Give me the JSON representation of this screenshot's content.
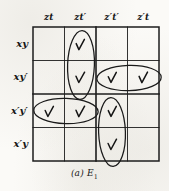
{
  "figure": {
    "type": "karnaugh-map",
    "caption_label": "(a)",
    "caption_expression": "E",
    "caption_subscript": "1",
    "ink_color": "#1a1a1a",
    "paper_color": "#fbfaf7"
  },
  "grid": {
    "rows": 4,
    "columns": 4,
    "column_headers": [
      {
        "id": "col-zt",
        "label": "zt"
      },
      {
        "id": "col-ztp",
        "label": "zt′"
      },
      {
        "id": "col-zptp",
        "label": "z′t′"
      },
      {
        "id": "col-zpt",
        "label": "z′t"
      }
    ],
    "row_headers": [
      {
        "id": "row-xy",
        "label": "xy"
      },
      {
        "id": "row-xyp",
        "label": "xy′"
      },
      {
        "id": "row-xpyp",
        "label": "x′y′"
      },
      {
        "id": "row-xpy",
        "label": "x′y"
      }
    ]
  },
  "marks": [
    {
      "id": "mark-r1c2",
      "row": 1,
      "col": 2,
      "glyph": "check"
    },
    {
      "id": "mark-r2c2",
      "row": 2,
      "col": 2,
      "glyph": "check"
    },
    {
      "id": "mark-r2c3",
      "row": 2,
      "col": 3,
      "glyph": "check"
    },
    {
      "id": "mark-r2c4",
      "row": 2,
      "col": 4,
      "glyph": "check"
    },
    {
      "id": "mark-r3c1",
      "row": 3,
      "col": 1,
      "glyph": "check"
    },
    {
      "id": "mark-r3c2",
      "row": 3,
      "col": 2,
      "glyph": "check"
    },
    {
      "id": "mark-r3c3",
      "row": 3,
      "col": 3,
      "glyph": "check"
    },
    {
      "id": "mark-r4c3",
      "row": 4,
      "col": 3,
      "glyph": "check"
    }
  ],
  "groupings": [
    {
      "id": "loop-vertical-ztp-rows12",
      "orientation": "vertical",
      "cells": "zt′ × (xy, xy′)"
    },
    {
      "id": "loop-horizontal-xyp-cols34",
      "orientation": "horizontal",
      "cells": "xy′ × (z′t′, z′t)"
    },
    {
      "id": "loop-horizontal-xpyp-cols12",
      "orientation": "horizontal",
      "cells": "x′y′ × (zt, zt′)"
    },
    {
      "id": "loop-vertical-zptp-rows34",
      "orientation": "vertical",
      "cells": "z′t′ × (x′y′, x′y)"
    }
  ]
}
